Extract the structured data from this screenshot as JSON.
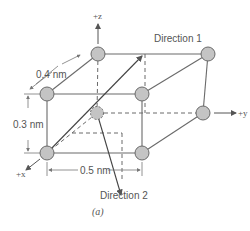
{
  "figure": {
    "caption": "(a)",
    "axes": {
      "z": "+z",
      "y": "+y",
      "x": "+x"
    },
    "dimensions": {
      "depth": "0.4 nm",
      "height": "0.3 nm",
      "width": "0.5 nm"
    },
    "directions": {
      "d1": "Direction 1",
      "d2": "Direction 2"
    },
    "colors": {
      "atom_fill": "#c4c4c4",
      "atom_stroke": "#6a6a6a",
      "line": "#6a6a6a",
      "text": "#555555"
    },
    "atoms": [
      {
        "id": "back-top-left",
        "x": 98,
        "y": 54
      },
      {
        "id": "back-top-right",
        "x": 208,
        "y": 54
      },
      {
        "id": "front-top-left",
        "x": 47,
        "y": 94
      },
      {
        "id": "front-top-right",
        "x": 142,
        "y": 94
      },
      {
        "id": "back-bottom-left",
        "x": 97,
        "y": 113
      },
      {
        "id": "back-bottom-right",
        "x": 203,
        "y": 113
      },
      {
        "id": "front-bottom-left",
        "x": 47,
        "y": 153
      },
      {
        "id": "front-bottom-right",
        "x": 142,
        "y": 153
      }
    ]
  }
}
